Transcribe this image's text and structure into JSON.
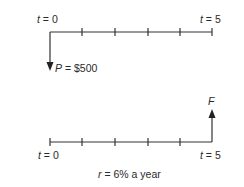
{
  "diagram": {
    "type": "cash-flow-timeline",
    "top_timeline": {
      "start_label_var": "t",
      "start_label_rest": " = 0",
      "end_label_var": "t",
      "end_label_rest": " = 5",
      "periods": 5,
      "cash_flow": {
        "direction": "down",
        "at_period": 0,
        "label_var": "P",
        "label_rest": " = $500"
      }
    },
    "bottom_timeline": {
      "start_label_var": "t",
      "start_label_rest": " = 0",
      "end_label_var": "t",
      "end_label_rest": " = 5",
      "periods": 5,
      "cash_flow": {
        "direction": "up",
        "at_period": 5,
        "label_var": "F",
        "label_rest": ""
      }
    },
    "rate_label_var": "r",
    "rate_label_rest": " = 6% a year"
  }
}
